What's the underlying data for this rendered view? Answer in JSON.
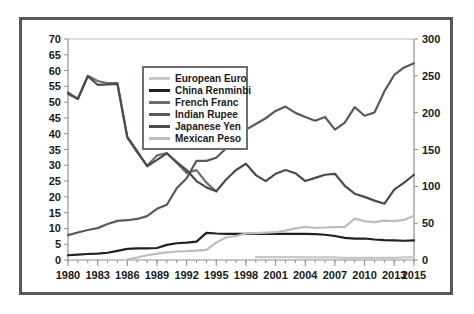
{
  "chart_data": {
    "type": "line",
    "title": "",
    "subtitle": "",
    "xlabel": "",
    "ylabel": "",
    "y2label": "",
    "xlim": [
      1980,
      2015
    ],
    "ylim": [
      0,
      70
    ],
    "y2lim": [
      0,
      300
    ],
    "grid": false,
    "legend_position": "upper-left-inside",
    "x_tick_labels": [
      "1980",
      "1983",
      "1986",
      "1989",
      "1992",
      "1995",
      "1998",
      "2001",
      "2004",
      "2007",
      "2010",
      "2013",
      "2015"
    ],
    "x_tick_values": [
      1980,
      1983,
      1986,
      1989,
      1992,
      1995,
      1998,
      2001,
      2004,
      2007,
      2010,
      2013,
      2015
    ],
    "x_minor_tick_step": 1,
    "y_tick_labels": [
      "0",
      "5",
      "10",
      "15",
      "20",
      "25",
      "30",
      "35",
      "40",
      "45",
      "50",
      "55",
      "60",
      "65",
      "70"
    ],
    "y_tick_values": [
      0,
      5,
      10,
      15,
      20,
      25,
      30,
      35,
      40,
      45,
      50,
      55,
      60,
      65,
      70
    ],
    "y2_tick_labels": [
      "0",
      "50",
      "100",
      "150",
      "200",
      "250",
      "300"
    ],
    "y2_tick_values": [
      0,
      50,
      100,
      150,
      200,
      250,
      300
    ],
    "x": [
      1980,
      1981,
      1982,
      1983,
      1984,
      1985,
      1986,
      1987,
      1988,
      1989,
      1990,
      1991,
      1992,
      1993,
      1994,
      1995,
      1996,
      1997,
      1998,
      1999,
      2000,
      2001,
      2002,
      2003,
      2004,
      2005,
      2006,
      2007,
      2008,
      2009,
      2010,
      2011,
      2012,
      2013,
      2014,
      2015
    ],
    "series": [
      {
        "name": "European Euro",
        "color": "#c7c8ca",
        "axis": "left",
        "width": 2.2,
        "start_year": 1999,
        "values": [
          null,
          null,
          null,
          null,
          null,
          null,
          null,
          null,
          null,
          null,
          null,
          null,
          null,
          null,
          null,
          null,
          null,
          null,
          null,
          0.9,
          0.9,
          0.9,
          0.9,
          0.9,
          0.8,
          0.8,
          0.8,
          0.8,
          0.7,
          0.7,
          0.7,
          0.7,
          0.7,
          0.7,
          0.8,
          0.9
        ]
      },
      {
        "name": "China Renminbi",
        "color": "#231f20",
        "axis": "left",
        "width": 2.2,
        "start_year": 1980,
        "values": [
          1.5,
          1.7,
          1.9,
          2.0,
          2.3,
          2.9,
          3.5,
          3.7,
          3.7,
          3.8,
          4.8,
          5.3,
          5.5,
          5.8,
          8.6,
          8.4,
          8.3,
          8.3,
          8.3,
          8.3,
          8.3,
          8.3,
          8.3,
          8.3,
          8.3,
          8.2,
          8.0,
          7.6,
          7.0,
          6.8,
          6.8,
          6.5,
          6.3,
          6.2,
          6.1,
          6.2
        ]
      },
      {
        "name": "French Franc",
        "color": "#6d6e71",
        "axis": "right",
        "width": 2.2,
        "start_year": 1980,
        "values": [
          225,
          219,
          250,
          243,
          240,
          240,
          166,
          146,
          128,
          142,
          145,
          132,
          118,
          122,
          105,
          93,
          null,
          null,
          null,
          null,
          null,
          null,
          null,
          null,
          null,
          null,
          null,
          null,
          null,
          null,
          null,
          null,
          null,
          null,
          null,
          null
        ]
      },
      {
        "name": "Indian Rupee",
        "color": "#58595b",
        "axis": "left",
        "width": 2.2,
        "start_year": 1980,
        "values": [
          7.9,
          8.7,
          9.5,
          10.1,
          11.4,
          12.4,
          12.6,
          13.0,
          13.9,
          16.2,
          17.5,
          22.7,
          25.9,
          31.4,
          31.4,
          32.4,
          35.4,
          36.3,
          41.3,
          43.1,
          44.9,
          47.2,
          48.6,
          46.6,
          45.3,
          44.1,
          45.3,
          41.3,
          43.5,
          48.4,
          45.7,
          46.7,
          53.4,
          58.6,
          61.0,
          62.3
        ]
      },
      {
        "name": "Japanese Yen",
        "color": "#4a4b4d",
        "axis": "left",
        "width": 2.2,
        "start_year": 1980,
        "values": [
          53.0,
          51.0,
          58.2,
          55.5,
          55.6,
          55.8,
          39.0,
          34.5,
          29.7,
          31.7,
          33.8,
          31.0,
          28.5,
          25.0,
          23.0,
          21.8,
          25.5,
          28.5,
          30.5,
          26.9,
          25.0,
          27.3,
          28.5,
          27.5,
          25.0,
          26.0,
          27.0,
          27.3,
          23.5,
          21.0,
          20.0,
          18.8,
          17.8,
          22.3,
          24.5,
          27.0
        ]
      },
      {
        "name": "Mexican Peso",
        "color": "#bcbdbf",
        "axis": "left",
        "width": 2.2,
        "start_year": 1986,
        "values": [
          null,
          null,
          null,
          null,
          null,
          null,
          0.2,
          0.8,
          1.5,
          2.0,
          2.4,
          2.7,
          2.8,
          3.0,
          3.2,
          5.5,
          7.2,
          7.6,
          8.4,
          8.5,
          8.7,
          8.8,
          9.3,
          10.0,
          10.5,
          10.2,
          10.3,
          10.4,
          10.5,
          13.1,
          12.3,
          12.0,
          12.5,
          12.3,
          12.7,
          14.0
        ]
      }
    ]
  },
  "legend": {
    "items": [
      {
        "label": "European Euro"
      },
      {
        "label": "China Renminbi"
      },
      {
        "label": "French Franc"
      },
      {
        "label": "Indian Rupee"
      },
      {
        "label": "Japanese Yen"
      },
      {
        "label": "Mexican Peso"
      }
    ]
  },
  "colors": {
    "frame": "#58595b",
    "background": "#ffffff",
    "axis": "#8d8f92",
    "text": "#1a1a1a"
  }
}
